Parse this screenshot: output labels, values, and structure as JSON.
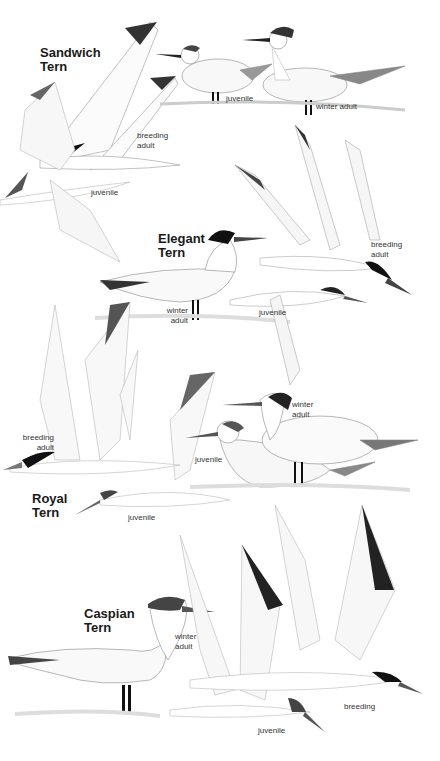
{
  "plate": {
    "colors": {
      "background": "#ffffff",
      "ink": "#1a1a1a",
      "wash": "#d9d9d9",
      "cap": "#111111"
    },
    "species": [
      {
        "name": "Sandwich\nTern",
        "labels": [
          {
            "text": "juvenile",
            "context": "standing"
          },
          {
            "text": "winter adult",
            "context": "standing"
          },
          {
            "text": "breeding\nadult",
            "context": "flying"
          },
          {
            "text": "juvenile",
            "context": "flying"
          }
        ]
      },
      {
        "name": "Elegant\nTern",
        "labels": [
          {
            "text": "winter\nadult",
            "context": "standing"
          },
          {
            "text": "juvenile",
            "context": "flying"
          },
          {
            "text": "breeding\nadult",
            "context": "flying"
          }
        ]
      },
      {
        "name": "Royal\nTern",
        "labels": [
          {
            "text": "winter\nadult",
            "context": "standing"
          },
          {
            "text": "juvenile",
            "context": "standing"
          },
          {
            "text": "breeding\nadult",
            "context": "flying"
          },
          {
            "text": "juvenile",
            "context": "flying"
          }
        ]
      },
      {
        "name": "Caspian\nTern",
        "labels": [
          {
            "text": "winter\nadult",
            "context": "standing"
          },
          {
            "text": "breeding",
            "context": "flying"
          },
          {
            "text": "juvenile",
            "context": "flying"
          }
        ]
      }
    ]
  }
}
